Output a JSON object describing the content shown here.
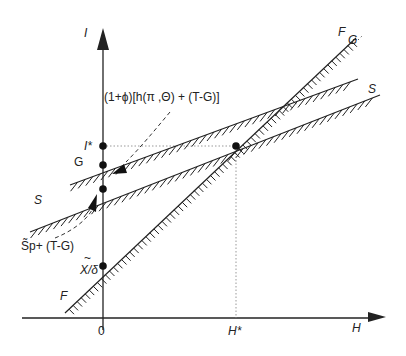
{
  "diagram": {
    "axes": {
      "y_label": "I",
      "x_label": "H",
      "origin_label": "0"
    },
    "lines": {
      "F": {
        "label_top": "F",
        "label_bottom": "F"
      },
      "G": {
        "label_left": "G",
        "label_right": "G"
      },
      "S": {
        "label_left": "S",
        "label_right": "S"
      }
    },
    "points": {
      "i_star": "I*",
      "h_star": "H*",
      "x_delta": "X/δ",
      "x_tilde": "~"
    },
    "annotations": {
      "upper_expr": "(1+ϕ)[h(π ,Θ) + (T-G)]",
      "lower_expr": "S̃p+ (T-G)"
    },
    "colors": {
      "line": "#222222",
      "dotted": "#999999"
    }
  }
}
